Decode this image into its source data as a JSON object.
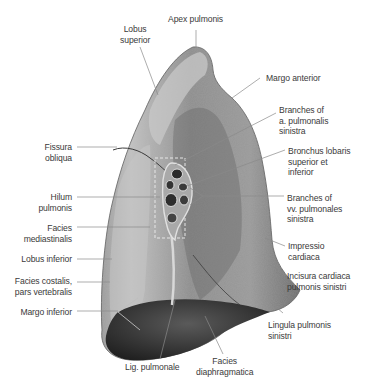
{
  "figure": {
    "colors": {
      "background": "#ffffff",
      "lung_light": "#b9b9b9",
      "lung_mid": "#8f8f8f",
      "lung_dark": "#4a4a4a",
      "diaphragm_dark": "#2c2c2c",
      "leader_line": "#8a8a8a",
      "label_text": "#3a3a3a"
    }
  },
  "labels": {
    "apex": "Apex pulmonis",
    "lobus_superior": "Lobus\nsuperior",
    "margo_anterior": "Margo anterior",
    "branches_a_pulm": "Branches of\na. pulmonalis\nsinistra",
    "bronchus": "Bronchus lobaris\nsuperior et\ninferior",
    "branches_vv_pulm": "Branches of\nvv. pulmonales\nsinistra",
    "impressio": "Impressio\ncardiaca",
    "incisura": "Incisura cardiaca\npulmonis sinistri",
    "lingula": "Lingula pulmonis\nsinistri",
    "fissura": "Fissura\nobliqua",
    "hilum": "Hilum\npulmonis",
    "facies_med": "Facies\nmediastinalis",
    "lobus_inferior": "Lobus inferior",
    "facies_costalis": "Facies costalis,\npars vertebralis",
    "margo_inferior": "Margo inferior",
    "lig_pulmonale": "Lig. pulmonale",
    "facies_diaph": "Facies\ndiaphragmatica"
  }
}
